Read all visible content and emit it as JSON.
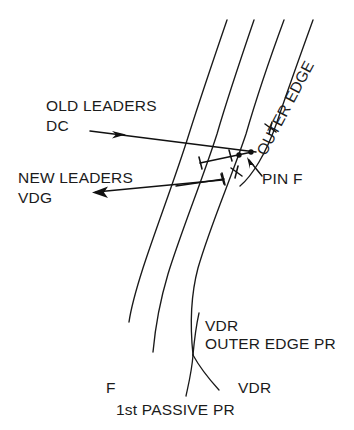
{
  "diagram": {
    "background_color": "#ffffff",
    "ink_color": "#111111",
    "labels": {
      "old_leaders_line1": "OLD LEADERS",
      "old_leaders_line2": "DC",
      "new_leaders_line1": "NEW LEADERS",
      "new_leaders_line2": "VDG",
      "pin_f": "PIN F",
      "outer_edge": "OUTER EDGE",
      "vdr_upper": "VDR",
      "outer_edge_pr": "OUTER EDGE PR",
      "f": "F",
      "vdr_lower": "VDR",
      "first_passive_pr": "1st PASSIVE PR"
    },
    "icons": {
      "old_leaders_arrow": "arrow-right-icon",
      "new_leaders_arrow": "arrow-left-icon",
      "pin_f_pointer": "arrow-up-left-icon",
      "pin_marker": "pin-dot-icon"
    },
    "geometry": {
      "thread_curves": [
        "M227,20 C214,58 201,96 189,134 C176,176 156,228 143,268 C135,293 131,308 129,322",
        "M254,20 C241,58 228,96 217,134 C203,178 181,232 168,274 C159,304 155,330 153,352",
        "M284,20 C270,58 257,96 246,134 C232,176 210,226 198,268 C190,298 190,326 193,355",
        "M313,20 C300,56 287,92 277,122 C266,154 252,176 240,186"
      ],
      "branch_curves": [
        "M193,355 C192,370 189,382 186,396",
        "M193,355 C200,368 209,379 219,390"
      ],
      "leader_lines": [
        {
          "name": "old-leaders-leader",
          "path": "M90,131 L256,152"
        },
        {
          "name": "new-leaders-leader",
          "path": "M96,192 L222,180"
        }
      ],
      "pin_dots": [
        {
          "cx": 239,
          "cy": 155,
          "r": 2.6
        },
        {
          "cx": 251,
          "cy": 152,
          "r": 2.6
        }
      ]
    }
  }
}
